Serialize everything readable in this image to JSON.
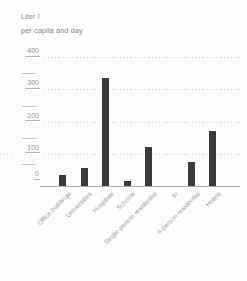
{
  "title": {
    "line1": "Liter l",
    "line2": "per capita and day"
  },
  "chart_data": {
    "type": "bar",
    "title": "Liter l per capita and day",
    "ylabel": "Liter l per capita and day",
    "xlabel": "",
    "ylim": [
      0,
      400
    ],
    "yticks": [
      0,
      100,
      200,
      300,
      400
    ],
    "grid": "horizontal dotted gridlines at each 100 step, solid baseline at 0",
    "legend": "none",
    "categories": [
      "Office buildings",
      "Universities",
      "Hospitals",
      "Schools",
      "Single-person residential",
      "to",
      "6-person residential",
      "Hotels"
    ],
    "values": [
      35,
      55,
      335,
      15,
      120,
      null,
      75,
      170
    ],
    "bar_color": "#3a3a3a"
  },
  "colors": {
    "background": "#fdfdfd",
    "bar": "#3a3a3a",
    "axis_text": "#979797",
    "label_text": "#9b9b9b",
    "gridline": "#d2d2d2",
    "baseline": "#ababab"
  }
}
